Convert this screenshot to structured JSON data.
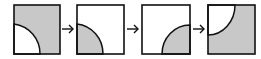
{
  "diagram": {
    "colors": {
      "fill": "#c8c8c8",
      "stroke": "#111111",
      "background": "#ffffff"
    },
    "panels": [
      {
        "id": 1,
        "background": "shaded",
        "quarter_circle_corner": "bottom-left",
        "quarter_circle_fill": "white"
      },
      {
        "id": 2,
        "background": "white",
        "quarter_circle_corner": "bottom-left",
        "quarter_circle_fill": "shaded"
      },
      {
        "id": 3,
        "background": "white",
        "quarter_circle_corner": "bottom-right",
        "quarter_circle_fill": "shaded"
      },
      {
        "id": 4,
        "background": "shaded",
        "quarter_circle_corner": "top-left",
        "quarter_circle_fill": "white"
      }
    ],
    "arrows": [
      {
        "from": 1,
        "to": 2,
        "icon": "arrow-right-icon"
      },
      {
        "from": 2,
        "to": 3,
        "icon": "arrow-right-icon"
      },
      {
        "from": 3,
        "to": 4,
        "icon": "arrow-right-icon"
      }
    ]
  }
}
